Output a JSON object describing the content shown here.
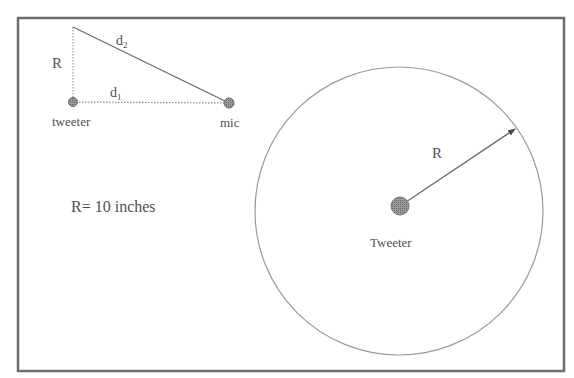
{
  "figure": {
    "frame": {
      "x": 18,
      "y": 18,
      "width": 546,
      "height": 353
    },
    "colors": {
      "frame": "#6e6e6e",
      "line": "#6a6a6a",
      "dotted": "#8a8a8a",
      "circle": "#9a9a9a",
      "dot_fill": "#8c8c8c",
      "text": "#505050"
    }
  },
  "triangle": {
    "top_vertex": {
      "x": 73,
      "y": 27
    },
    "tweeter": {
      "x": 73,
      "y": 102,
      "label": "tweeter"
    },
    "mic": {
      "x": 229,
      "y": 103,
      "label": "mic"
    },
    "side_labels": {
      "vertical": "R",
      "hypotenuse": "d",
      "hypotenuse_sub": "2",
      "horizontal": "d",
      "horizontal_sub": "1"
    }
  },
  "annotation": {
    "radius_value": "R= 10 inches"
  },
  "circle": {
    "center": {
      "x": 399,
      "y": 208
    },
    "radius": 144,
    "arrow_tip": {
      "x": 515,
      "y": 129
    },
    "radius_label": "R",
    "tweeter_label": "Tweeter"
  }
}
